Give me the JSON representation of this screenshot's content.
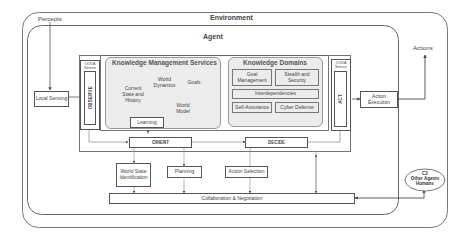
{
  "environment": {
    "label": "Environment"
  },
  "agent": {
    "label": "Agent"
  },
  "percepts": {
    "label": "Percepts"
  },
  "actions": {
    "label": "Actions"
  },
  "local_sensing": {
    "label": "Local Sensing"
  },
  "action_execution": {
    "label": "Action Execution"
  },
  "ooda_left": {
    "service_label": "OODA Service",
    "phase": "OBSERVE"
  },
  "ooda_right": {
    "service_label": "OODA Service",
    "phase": "ACT"
  },
  "knowledge_management": {
    "title": "Knowledge Management Services",
    "stores": [
      {
        "label": "Current State and History"
      },
      {
        "label": "World Dynamics"
      },
      {
        "label": "Goals"
      },
      {
        "label": "World Model"
      }
    ],
    "learning": "Learning"
  },
  "knowledge_domains": {
    "title": "Knowledge Domains",
    "items": [
      {
        "label": "Goal Management"
      },
      {
        "label": "Stealth and Security"
      },
      {
        "label": "Interdependencies"
      },
      {
        "label": "Self-Assurance"
      },
      {
        "label": "Cyber Defense"
      }
    ]
  },
  "orient": {
    "label": "ORIENT"
  },
  "decide": {
    "label": "DECIDE"
  },
  "sub_services": {
    "world_state": "World State Identification",
    "planning": "Planning",
    "action_selection": "Action Selection"
  },
  "collaboration": {
    "label": "Collaboration & Negotiation"
  },
  "external": {
    "line1": "C2",
    "line2": "Other Agents",
    "line3": "Humans"
  },
  "colors": {
    "border": "#555555",
    "panel_fill": "#ececec",
    "line": "#666666"
  }
}
